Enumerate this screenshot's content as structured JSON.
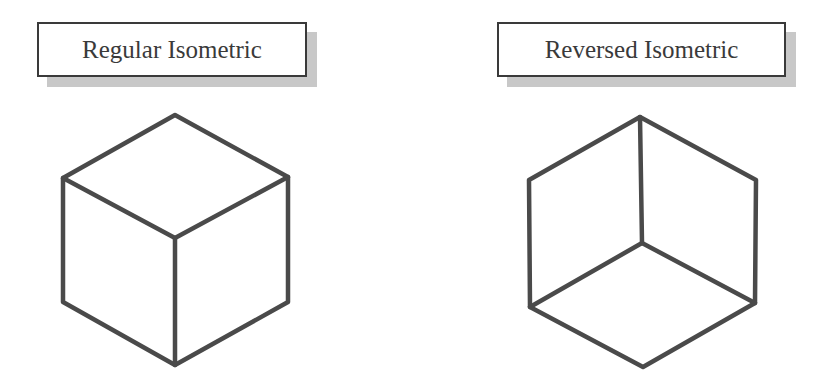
{
  "labels": {
    "left": "Regular Isometric",
    "right": "Reversed Isometric"
  },
  "colors": {
    "line": "#4a4a4a",
    "shadow": "#c8c8c8",
    "background": "#ffffff"
  },
  "cubes": {
    "regular": {
      "outline": [
        [
          175,
          115
        ],
        [
          288,
          177
        ],
        [
          288,
          302
        ],
        [
          175,
          365
        ],
        [
          63,
          302
        ],
        [
          63,
          178
        ]
      ],
      "inner_edges": [
        [
          [
            63,
            178
          ],
          [
            175,
            238
          ]
        ],
        [
          [
            288,
            177
          ],
          [
            175,
            238
          ]
        ],
        [
          [
            175,
            238
          ],
          [
            175,
            365
          ]
        ]
      ]
    },
    "reversed": {
      "outline": [
        [
          640,
          117
        ],
        [
          756,
          180
        ],
        [
          755,
          303
        ],
        [
          643,
          367
        ],
        [
          530,
          307
        ],
        [
          529,
          180
        ]
      ],
      "inner_edges": [
        [
          [
            640,
            117
          ],
          [
            642,
            243
          ]
        ],
        [
          [
            530,
            307
          ],
          [
            642,
            243
          ]
        ],
        [
          [
            755,
            303
          ],
          [
            642,
            243
          ]
        ]
      ]
    }
  }
}
